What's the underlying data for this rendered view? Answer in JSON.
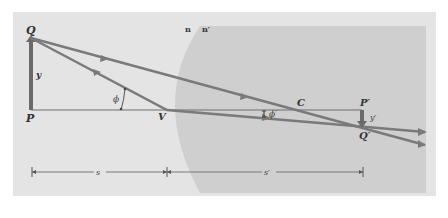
{
  "figure": {
    "colors": {
      "page_background": "#ffffff",
      "panel_background": "#e4e4e4",
      "medium_background": "#cfcfcf",
      "ray": "#7a7a7a",
      "axis": "#6e6e6e",
      "object_arrow": "#6a6a6a",
      "label": "#333333"
    },
    "labels": {
      "object_top": "Q",
      "object_base": "P",
      "object_height": "y",
      "vertex": "V",
      "center": "C",
      "image_base": "P′",
      "image_tip": "Q′",
      "image_height": "y′",
      "incident_angle": "ϕ",
      "refracted_angle": "ϕ′",
      "index_left": "n",
      "index_right": "n′",
      "object_distance": "s",
      "image_distance": "s′"
    },
    "rays": [
      {
        "name": "ray-through-center",
        "from": "Q",
        "via": "C",
        "to": "beyond-Q′"
      },
      {
        "name": "ray-through-vertex",
        "from": "Q",
        "via": "V",
        "to": "beyond-Q′"
      }
    ]
  }
}
